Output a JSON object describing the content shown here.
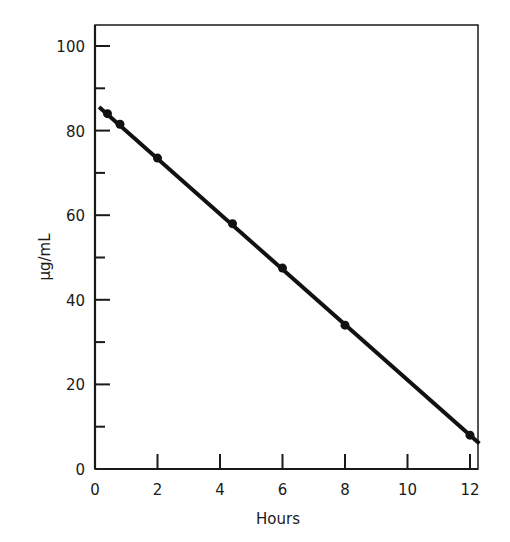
{
  "chart_data": {
    "type": "line",
    "title": "",
    "xlabel": "Hours",
    "ylabel": "μg/mL",
    "xlim": [
      0,
      12.3
    ],
    "ylim": [
      0,
      105
    ],
    "grid": false,
    "legend": null,
    "x_ticks": [
      0,
      2,
      4,
      6,
      8,
      10,
      12
    ],
    "y_ticks_major": [
      0,
      20,
      40,
      60,
      80,
      100
    ],
    "y_ticks_minor": [
      10,
      30,
      50,
      70,
      90
    ],
    "series": [
      {
        "name": "concentration",
        "points": [
          {
            "x": 0.4,
            "y": 84
          },
          {
            "x": 0.8,
            "y": 81.5
          },
          {
            "x": 2.0,
            "y": 73.5
          },
          {
            "x": 4.4,
            "y": 58
          },
          {
            "x": 6.0,
            "y": 47.5
          },
          {
            "x": 8.0,
            "y": 34
          },
          {
            "x": 12.0,
            "y": 8
          }
        ],
        "fit_line": {
          "x_start": 0.13,
          "y_start": 85.6,
          "x_end": 12.3,
          "y_end": 6
        }
      }
    ]
  },
  "axes": {
    "x_title": "Hours",
    "y_title": "μg/mL"
  }
}
